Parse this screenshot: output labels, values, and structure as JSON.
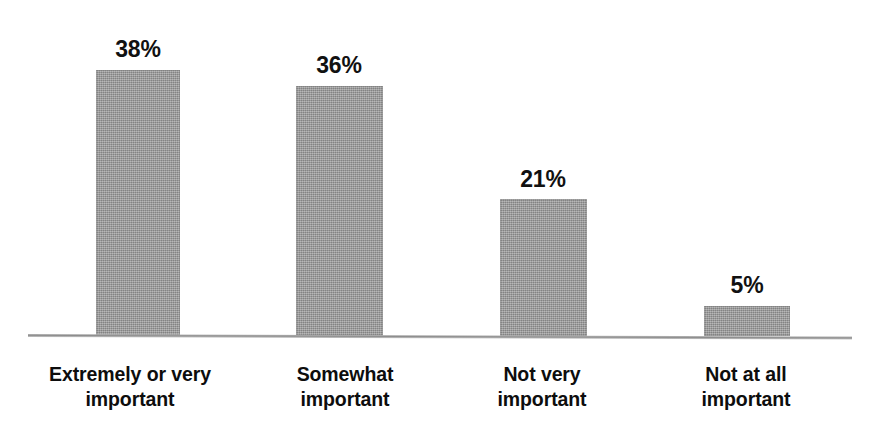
{
  "chart_data": {
    "type": "bar",
    "title": "",
    "subtitle": "",
    "xlabel": "",
    "ylabel": "",
    "grid": false,
    "legend": false,
    "legend_position": "none",
    "axis": {
      "baseline_only": true,
      "ylim": [
        0,
        44
      ],
      "tick_labels": [],
      "value_suffix": "%"
    },
    "categories": [
      "Extremely or very important",
      "Somewhat important",
      "Not very important",
      "Not at all important"
    ],
    "category_lines": [
      [
        "Extremely or very",
        "important"
      ],
      [
        "Somewhat",
        "important"
      ],
      [
        "Not very",
        "important"
      ],
      [
        "Not at all",
        "important"
      ]
    ],
    "values": [
      38,
      36,
      21,
      5
    ],
    "value_labels": [
      "38%",
      "36%",
      "21%",
      "5%"
    ],
    "colors": {
      "bar_fill": "#9b9b9b",
      "axis_line": "#8d8d8d",
      "label_text": "#0d0d0d",
      "value_text": "#111111",
      "background": "#ffffff"
    }
  },
  "geometry": {
    "bars": [
      {
        "left": 96,
        "top": 70,
        "width": 84,
        "height": 266
      },
      {
        "left": 296,
        "top": 86,
        "width": 87,
        "height": 250
      },
      {
        "left": 500,
        "top": 199,
        "width": 87,
        "height": 137
      },
      {
        "left": 704,
        "top": 306,
        "width": 86,
        "height": 30
      }
    ],
    "value_label_centers": [
      138,
      339,
      543,
      747
    ],
    "value_label_tops": [
      36,
      52,
      166,
      272
    ],
    "category_centers": [
      130,
      345,
      542,
      746
    ]
  }
}
